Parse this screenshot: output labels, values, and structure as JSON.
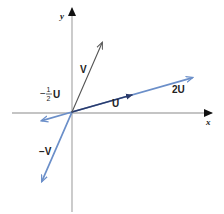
{
  "diagram": {
    "type": "vector-diagram",
    "axes": {
      "x_label": "x",
      "y_label": "y"
    },
    "vectors": [
      {
        "id": "V",
        "label": "V",
        "components": [
          1,
          2.3
        ],
        "color": "#555555"
      },
      {
        "id": "U",
        "label": "U",
        "components": [
          2,
          0.57
        ],
        "color": "#2a3a6a"
      },
      {
        "id": "2U",
        "label": "2U",
        "components": [
          4,
          1.14
        ],
        "color": "#6b8fc9"
      },
      {
        "id": "neg_half_U",
        "label_minus": "−",
        "label_num": "1",
        "label_den": "2",
        "label_vec": "U",
        "components": [
          -1,
          -0.285
        ],
        "color": "#6b8fc9"
      },
      {
        "id": "neg_V",
        "label": "−V",
        "components": [
          -1,
          -2.3
        ],
        "color": "#6b8fc9"
      }
    ],
    "colors": {
      "axis": "#b0b0b0",
      "axis_arrow": "#111111"
    }
  }
}
